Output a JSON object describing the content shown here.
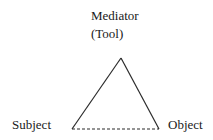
{
  "diagram": {
    "type": "activity-theory-triangle",
    "nodes": {
      "top": {
        "label_line1": "Mediator",
        "label_line2": "(Tool)"
      },
      "left": {
        "label": "Subject"
      },
      "right": {
        "label": "Object"
      }
    },
    "edges": [
      {
        "from": "Subject",
        "to": "Mediator (Tool)",
        "style": "solid"
      },
      {
        "from": "Mediator (Tool)",
        "to": "Object",
        "style": "solid"
      },
      {
        "from": "Subject",
        "to": "Object",
        "style": "dashed"
      }
    ],
    "colors": {
      "line": "#2a2a2a",
      "text": "#1a1a1a",
      "background": "#ffffff"
    }
  }
}
